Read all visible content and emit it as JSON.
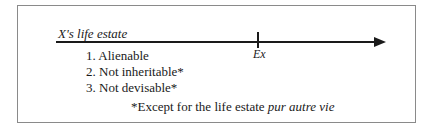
{
  "diagram": {
    "timeline_label": "X's life estate",
    "event_label": "Ex",
    "characteristics": [
      "1. Alienable",
      "2. Not inheritable*",
      "3. Not devisable*"
    ],
    "footnote": {
      "prefix": "*Except for the life estate ",
      "emphasis": "pur autre vie"
    }
  }
}
